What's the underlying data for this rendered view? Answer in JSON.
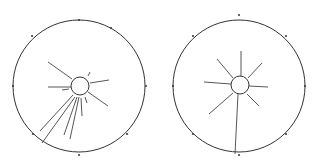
{
  "figure": {
    "panels": [
      {
        "id": "left",
        "outer": {
          "cx": 79,
          "cy": 86,
          "r": 66
        },
        "inner": {
          "cx": 80,
          "cy": 86,
          "r": 9
        },
        "ticks": [
          [
            79,
            20
          ],
          [
            111,
            28
          ],
          [
            146,
            86
          ],
          [
            127,
            134
          ],
          [
            79,
            155
          ],
          [
            33,
            134
          ],
          [
            13,
            86
          ],
          [
            32,
            36
          ]
        ],
        "rays": [
          [
            48,
            62,
            72,
            79
          ],
          [
            90,
            72,
            88,
            76
          ],
          [
            90,
            83,
            109,
            80
          ],
          [
            88,
            92,
            108,
            106
          ],
          [
            48,
            87,
            71,
            87
          ],
          [
            62,
            90,
            69,
            89
          ],
          [
            40,
            131,
            73,
            95
          ],
          [
            42,
            143,
            75,
            97
          ],
          [
            64,
            135,
            77,
            97
          ],
          [
            70,
            139,
            79,
            97
          ],
          [
            82,
            116,
            81,
            98
          ],
          [
            87,
            103,
            85,
            97
          ]
        ]
      },
      {
        "id": "right",
        "outer": {
          "cx": 239,
          "cy": 86,
          "r": 66
        },
        "inner": {
          "cx": 240,
          "cy": 85,
          "r": 9
        },
        "ticks": [
          [
            239,
            15
          ],
          [
            193,
            36
          ],
          [
            173,
            86
          ],
          [
            193,
            134
          ],
          [
            239,
            155
          ],
          [
            286,
            134
          ],
          [
            305,
            86
          ],
          [
            286,
            36
          ]
        ],
        "rays": [
          [
            241,
            51,
            241,
            76
          ],
          [
            217,
            59,
            233,
            78
          ],
          [
            262,
            63,
            248,
            78
          ],
          [
            204,
            82,
            231,
            84
          ],
          [
            268,
            87,
            249,
            86
          ],
          [
            209,
            114,
            233,
            93
          ],
          [
            259,
            106,
            247,
            94
          ],
          [
            235,
            154,
            238,
            94
          ]
        ]
      }
    ]
  }
}
